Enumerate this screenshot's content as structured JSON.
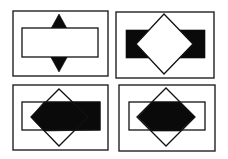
{
  "figure": {
    "colors": {
      "background": "#ffffff",
      "stroke": "#111111",
      "fill_dark": "#0a0a0a",
      "fill_light": "#ffffff"
    },
    "panels": [
      {
        "id": "top-left",
        "caption": "rectangle in front of dark diamond",
        "frame": [
          13,
          11,
          95,
          65
        ],
        "rect": [
          22,
          28,
          76,
          29
        ],
        "diamond": {
          "cx": 59,
          "cy": 43,
          "rx": 16,
          "ry": 29
        },
        "rect_style": "white-outline",
        "diamond_style": "black"
      },
      {
        "id": "top-right",
        "caption": "white diamond in front of dark rectangle",
        "frame": [
          116,
          12,
          98,
          66
        ],
        "rect": [
          126,
          30,
          79,
          28
        ],
        "diamond": {
          "cx": 164,
          "cy": 44,
          "rx": 28,
          "ry": 30
        },
        "rect_style": "black",
        "diamond_style": "white-outline"
      },
      {
        "id": "bottom-left",
        "caption": "transparent outlines with dark arrow-shaped overlap region",
        "frame": [
          13,
          85,
          95,
          65
        ],
        "rect": [
          22,
          102,
          78,
          28
        ],
        "diamond": {
          "cx": 59,
          "cy": 117,
          "rx": 29,
          "ry": 28
        },
        "rect_style": "outline",
        "diamond_style": "outline",
        "dark_region": "rect minus left diamond wedge"
      },
      {
        "id": "bottom-right",
        "caption": "transparent outlines with dark hexagonal intersection",
        "frame": [
          119,
          85,
          96,
          66
        ],
        "rect": [
          129,
          102,
          76,
          28
        ],
        "diamond": {
          "cx": 166,
          "cy": 117,
          "rx": 29,
          "ry": 29
        },
        "rect_style": "outline",
        "diamond_style": "outline",
        "dark_region": "rect ∩ diamond"
      }
    ]
  }
}
